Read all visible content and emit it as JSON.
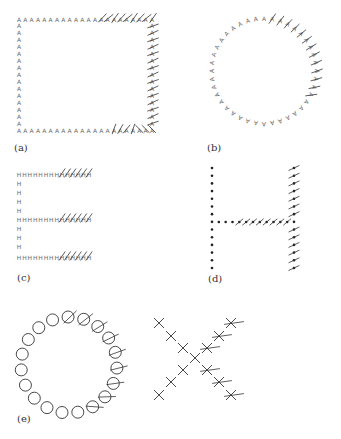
{
  "figure": {
    "panels": [
      {
        "id": "a",
        "label": "(a)",
        "shape": "square",
        "glyph": "A",
        "description": "square outline of A glyphs, top-right and right side and bottom-right marked with oriented line segments"
      },
      {
        "id": "b",
        "label": "(b)",
        "shape": "circle",
        "glyph": "A",
        "description": "circle of A glyphs (rotated), right half marked with oriented line segments"
      },
      {
        "id": "c",
        "label": "(c)",
        "shape": "letter-E",
        "glyph": "H",
        "description": "letter E made of H glyphs, right end of each bar marked with slanted strokes"
      },
      {
        "id": "d",
        "label": "(d)",
        "shape": "letter-H",
        "glyph": "dot",
        "description": "letter H made of dots, crossbar right half and right stem marked with oriented segments"
      },
      {
        "id": "e",
        "label": "(e)",
        "shape": "letters-O-X",
        "glyph": [
          "circle",
          "X"
        ],
        "description": "letter O made of circles and letter X made of X marks, right half overlaid with oriented line segments"
      }
    ]
  }
}
